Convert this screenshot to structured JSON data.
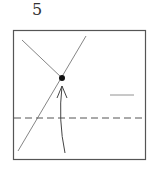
{
  "step": {
    "number": "5"
  },
  "diagram": {
    "square": {
      "x": 13,
      "y": 30,
      "w": 132,
      "h": 129
    },
    "dashed_line_y": 118,
    "colors": {
      "stroke": "#444444",
      "dot": "#111111"
    }
  }
}
